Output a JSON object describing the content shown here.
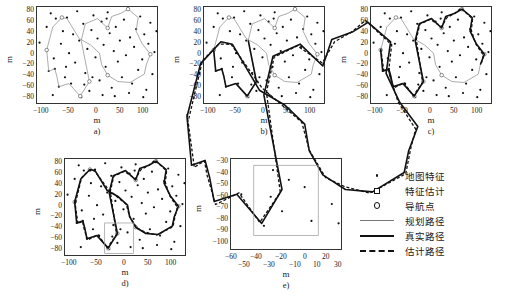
{
  "figure": {
    "axis_label": "m",
    "subplots": [
      {
        "id": "a",
        "caption": "a)",
        "xticks": [
          "-100",
          "-50",
          "0",
          "50",
          "100"
        ],
        "yticks": [
          "80",
          "60",
          "40",
          "20",
          "0",
          "-20",
          "-40",
          "-60",
          "-80"
        ],
        "xlim": [
          -125,
          115
        ],
        "ylim": [
          -95,
          92
        ],
        "shows": [
          "map-features",
          "planned-path"
        ]
      },
      {
        "id": "b",
        "caption": "b)",
        "xticks": [
          "-100",
          "-50",
          "0",
          "50",
          "100"
        ],
        "yticks": [
          "80",
          "60",
          "40",
          "20",
          "0",
          "-20",
          "-40",
          "-60",
          "-80"
        ],
        "xlim": [
          -125,
          115
        ],
        "ylim": [
          -95,
          92
        ],
        "shows": [
          "map-features",
          "planned-path",
          "true-path"
        ]
      },
      {
        "id": "c",
        "caption": "c)",
        "xticks": [
          "-100",
          "-50",
          "0",
          "50",
          "100"
        ],
        "yticks": [
          "80",
          "60",
          "40",
          "20",
          "0",
          "-20",
          "-40",
          "-60",
          "-80"
        ],
        "xlim": [
          -125,
          115
        ],
        "ylim": [
          -95,
          92
        ],
        "shows": [
          "map-features",
          "planned-path",
          "true-path",
          "estimated-path"
        ]
      },
      {
        "id": "d",
        "caption": "d)",
        "xticks": [
          "-100",
          "-50",
          "0",
          "50",
          "100"
        ],
        "yticks": [
          "80",
          "60",
          "40",
          "20",
          "0",
          "-20",
          "-40",
          "-60",
          "-80"
        ],
        "xlim": [
          -125,
          115
        ],
        "ylim": [
          -95,
          92
        ],
        "shows": [
          "map-features",
          "planned-path",
          "true-path",
          "estimated-path",
          "inset-box"
        ],
        "inset_box": {
          "x0": -45,
          "x1": 12,
          "y0": -90,
          "y1": -32
        }
      },
      {
        "id": "e",
        "caption": "e)",
        "xticks": [
          "-60",
          "-50",
          "-40",
          "-30",
          "-20",
          "-10",
          "0",
          "10",
          "20",
          "30"
        ],
        "yticks": [
          "-30",
          "-40",
          "-50",
          "-60",
          "-70",
          "-80",
          "-90",
          "-100"
        ],
        "xlim": [
          -66,
          33
        ],
        "ylim": [
          -102,
          -26
        ],
        "shows": [
          "map-features",
          "true-path",
          "estimated-path",
          "inset-box"
        ],
        "inset_box": {
          "x0": -45,
          "x1": 12,
          "y0": -90,
          "y1": -32
        }
      }
    ]
  },
  "legend": {
    "items": [
      {
        "marker": "filled-dot",
        "label": "地图特征"
      },
      {
        "marker": "open-square",
        "label": "特征估计"
      },
      {
        "marker": "open-circle",
        "label": "导航点"
      },
      {
        "marker": "thin-line",
        "label": "规划路径"
      },
      {
        "marker": "thick-line",
        "label": "真实路径"
      },
      {
        "marker": "dashed-line",
        "label": "估计路径"
      }
    ]
  },
  "chart_data": {
    "type": "scatter",
    "title": "",
    "xlabel": "m",
    "ylabel": "m",
    "grid": false,
    "legend_position": "right",
    "xlim": [
      -125,
      115
    ],
    "ylim": [
      -95,
      92
    ],
    "map_features": [
      [
        -118,
        22
      ],
      [
        -104,
        52
      ],
      [
        -104,
        8
      ],
      [
        -100,
        -32
      ],
      [
        -96,
        78
      ],
      [
        -92,
        -78
      ],
      [
        -88,
        -28
      ],
      [
        -86,
        68
      ],
      [
        -80,
        -62
      ],
      [
        -76,
        20
      ],
      [
        -72,
        44
      ],
      [
        -68,
        -44
      ],
      [
        -64,
        70
      ],
      [
        -60,
        2
      ],
      [
        -56,
        -56
      ],
      [
        -52,
        38
      ],
      [
        -48,
        -16
      ],
      [
        -44,
        82
      ],
      [
        -40,
        26
      ],
      [
        -36,
        -82
      ],
      [
        -32,
        58
      ],
      [
        -28,
        -36
      ],
      [
        -24,
        10
      ],
      [
        -20,
        -70
      ],
      [
        -16,
        46
      ],
      [
        -12,
        74
      ],
      [
        -8,
        -6
      ],
      [
        -4,
        30
      ],
      [
        0,
        -50
      ],
      [
        4,
        62
      ],
      [
        8,
        18
      ],
      [
        12,
        -24
      ],
      [
        16,
        80
      ],
      [
        20,
        40
      ],
      [
        24,
        -64
      ],
      [
        28,
        6
      ],
      [
        32,
        52
      ],
      [
        36,
        -14
      ],
      [
        40,
        26
      ],
      [
        44,
        -44
      ],
      [
        48,
        66
      ],
      [
        52,
        -2
      ],
      [
        56,
        86
      ],
      [
        60,
        32
      ],
      [
        64,
        -56
      ],
      [
        68,
        14
      ],
      [
        72,
        48
      ],
      [
        76,
        -30
      ],
      [
        80,
        72
      ],
      [
        84,
        -10
      ],
      [
        88,
        38
      ],
      [
        92,
        -68
      ],
      [
        96,
        20
      ],
      [
        100,
        60
      ],
      [
        104,
        -38
      ],
      [
        108,
        4
      ],
      [
        112,
        44
      ],
      [
        -90,
        -8
      ],
      [
        -66,
        -24
      ],
      [
        -30,
        -58
      ],
      [
        6,
        -78
      ],
      [
        30,
        -80
      ],
      [
        58,
        -74
      ],
      [
        86,
        -82
      ],
      [
        14,
        68
      ],
      [
        -14,
        -44
      ]
    ],
    "planned_path": [
      [
        -104,
        8
      ],
      [
        -100,
        -32
      ],
      [
        -88,
        -28
      ],
      [
        -84,
        -42
      ],
      [
        -80,
        -62
      ],
      [
        -60,
        -56
      ],
      [
        -38,
        -80
      ],
      [
        -20,
        -52
      ],
      [
        -36,
        26
      ],
      [
        -28,
        58
      ],
      [
        -4,
        68
      ],
      [
        16,
        50
      ],
      [
        24,
        72
      ],
      [
        42,
        78
      ],
      [
        56,
        86
      ],
      [
        76,
        70
      ],
      [
        72,
        44
      ],
      [
        84,
        20
      ],
      [
        100,
        0
      ],
      [
        92,
        -20
      ],
      [
        88,
        -38
      ],
      [
        60,
        -54
      ],
      [
        36,
        -52
      ],
      [
        16,
        -40
      ],
      [
        4,
        -20
      ],
      [
        0,
        2
      ],
      [
        -18,
        18
      ],
      [
        -40,
        30
      ],
      [
        -64,
        68
      ],
      [
        -74,
        70
      ],
      [
        -92,
        52
      ],
      [
        -104,
        8
      ]
    ],
    "true_path_progress": {
      "a": 0.0,
      "b": 0.3,
      "c": 0.62,
      "d": 1.0
    },
    "estimated_path_offset_m": 2.5,
    "navigation_points": [
      [
        -104,
        8
      ],
      [
        -38,
        -80
      ],
      [
        -20,
        -52
      ],
      [
        16,
        50
      ],
      [
        56,
        86
      ],
      [
        100,
        0
      ],
      [
        16,
        -40
      ],
      [
        -74,
        70
      ]
    ]
  }
}
